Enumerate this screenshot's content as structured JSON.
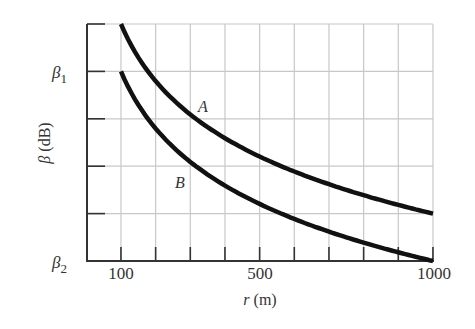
{
  "chart_data": {
    "type": "line",
    "title": "",
    "xlabel": "r (m)",
    "ylabel": "β (dB)",
    "xlim": [
      0,
      1000
    ],
    "x_gridlines": [
      100,
      200,
      300,
      400,
      500,
      600,
      700,
      800,
      900,
      1000
    ],
    "x_tick_labels": [
      {
        "value": 100,
        "label": "100"
      },
      {
        "value": 500,
        "label": "500"
      },
      {
        "value": 1000,
        "label": "1000"
      }
    ],
    "y_divisions": 5,
    "y_tick_labels": [
      {
        "division": 4,
        "label": "β₁",
        "base": "β",
        "sub": "1"
      },
      {
        "division": 0,
        "label": "β₂",
        "base": "β",
        "sub": "2"
      }
    ],
    "grid": true,
    "series": [
      {
        "name": "A",
        "x": [
          100,
          200,
          300,
          400,
          500,
          600,
          700,
          800,
          900,
          1000
        ],
        "y_divisions": [
          5.0,
          3.8,
          3.09,
          2.59,
          2.2,
          1.89,
          1.62,
          1.39,
          1.18,
          1.0
        ]
      },
      {
        "name": "B",
        "x": [
          100,
          200,
          300,
          400,
          500,
          600,
          700,
          800,
          900,
          1000
        ],
        "y_divisions": [
          4.0,
          2.8,
          2.09,
          1.59,
          1.2,
          0.89,
          0.62,
          0.39,
          0.18,
          0.0
        ]
      }
    ],
    "annotations": [
      {
        "text": "A",
        "series": "A"
      },
      {
        "text": "B",
        "series": "B"
      }
    ]
  },
  "labels": {
    "x_axis": {
      "base": "r",
      "unit": " (m)"
    },
    "y_axis": {
      "base": "β",
      "unit": " (dB)"
    },
    "beta1": {
      "base": "β",
      "sub": "1"
    },
    "beta2": {
      "base": "β",
      "sub": "2"
    },
    "x100": "100",
    "x500": "500",
    "x1000": "1000",
    "curveA": "A",
    "curveB": "B"
  }
}
